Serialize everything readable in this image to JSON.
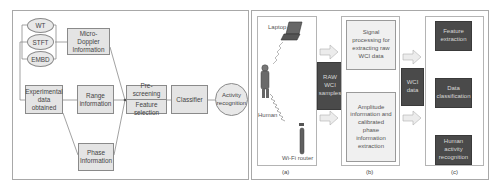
{
  "left_diagram": {
    "transforms": [
      "WT",
      "STFT",
      "EMBD"
    ],
    "micro_doppler": "Micro-Doppler Information",
    "experimental": "Experimental data obtained",
    "range": "Range information",
    "phase": "Phase Information",
    "prescreening": "Pre-screening",
    "feature_selection": "Feature selection",
    "classifier": "Classifier",
    "activity": "Activity recognition"
  },
  "right_diagram": {
    "panel_a": {
      "laptop": "Laptop",
      "human": "Human",
      "router": "Wi-Fi router",
      "caption": "(a)"
    },
    "raw_samples": "RAW WCI samples",
    "panel_b": {
      "signal": "Signal processing for extracting raw WCI data",
      "amplitude": "Amplitude information and calibrated phase information extraction",
      "caption": "(b)"
    },
    "wci_data": "WCI data",
    "panel_c": {
      "feature": "Feature extraction",
      "classification": "Data classification",
      "human_activity": "Human activity recognition",
      "caption": "(c)"
    }
  },
  "colors": {
    "box_fill": "#e4e4e4",
    "dark_fill": "#4a4a4a",
    "border": "#8a8a8a"
  }
}
